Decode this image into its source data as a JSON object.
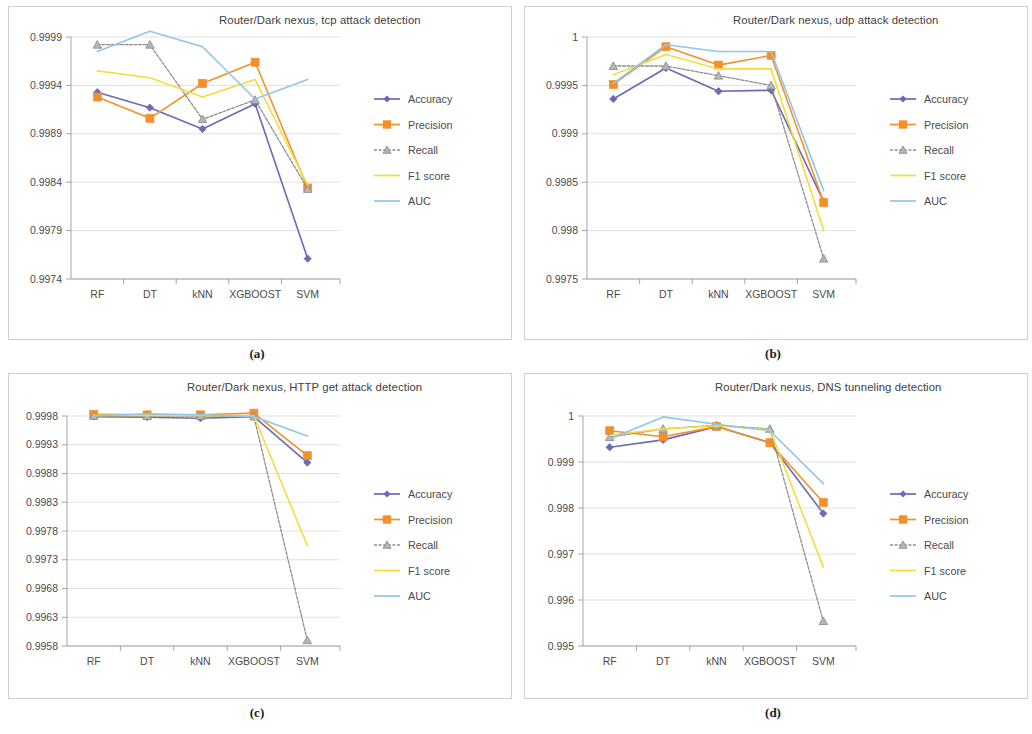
{
  "figure": {
    "panels": [
      {
        "caption": "(a)",
        "title": "Router/Dark nexus, tcp attack detection",
        "chart_data": {
          "type": "line",
          "title": "Router/Dark nexus, tcp attack detection",
          "xlabel": "",
          "ylabel": "",
          "categories": [
            "RF",
            "DT",
            "kNN",
            "XGBOOST",
            "SVM"
          ],
          "ylim": [
            0.9974,
            0.9999
          ],
          "yticks": [
            "0.9999",
            "0.9994",
            "0.9989",
            "0.9984",
            "0.9979",
            "0.9974"
          ],
          "ytick_values": [
            0.9999,
            0.9994,
            0.9989,
            0.9984,
            0.9979,
            0.9974
          ],
          "grid": true,
          "legend_position": "right",
          "series": [
            {
              "name": "Accuracy",
              "values": [
                0.99933,
                0.99917,
                0.99895,
                0.99921,
                0.99761
              ]
            },
            {
              "name": "Precision",
              "values": [
                0.99928,
                0.99906,
                0.99942,
                0.99964,
                0.99834
              ]
            },
            {
              "name": "Recall",
              "values": [
                0.99982,
                0.99982,
                0.99905,
                0.99925,
                0.99833
              ]
            },
            {
              "name": "F1 score",
              "values": [
                0.99955,
                0.99948,
                0.99928,
                0.99946,
                0.99837
              ]
            },
            {
              "name": "AUC",
              "values": [
                0.99975,
                0.99996,
                0.9998,
                0.99926,
                0.99946
              ]
            }
          ]
        }
      },
      {
        "caption": "(b)",
        "title": "Router/Dark nexus, udp attack detection",
        "chart_data": {
          "type": "line",
          "title": "Router/Dark nexus, udp attack detection",
          "xlabel": "",
          "ylabel": "",
          "categories": [
            "RF",
            "DT",
            "kNN",
            "XGBOOST",
            "SVM"
          ],
          "ylim": [
            0.9975,
            1.0
          ],
          "yticks": [
            "1",
            "0.9995",
            "0.999",
            "0.9985",
            "0.998",
            "0.9975"
          ],
          "ytick_values": [
            1.0,
            0.9995,
            0.999,
            0.9985,
            0.998,
            0.9975
          ],
          "grid": true,
          "legend_position": "right",
          "series": [
            {
              "name": "Accuracy",
              "values": [
                0.99936,
                0.99968,
                0.99944,
                0.99945,
                0.9983
              ]
            },
            {
              "name": "Precision",
              "values": [
                0.99951,
                0.9999,
                0.99971,
                0.99981,
                0.99829
              ]
            },
            {
              "name": "Recall",
              "values": [
                0.9997,
                0.9997,
                0.9996,
                0.9995,
                0.99771
              ]
            },
            {
              "name": "F1 score",
              "values": [
                0.99961,
                0.99982,
                0.99967,
                0.99967,
                0.998
              ]
            },
            {
              "name": "AUC",
              "values": [
                0.99952,
                0.99992,
                0.99985,
                0.99985,
                0.99841
              ]
            }
          ]
        }
      },
      {
        "caption": "(c)",
        "title": "Router/Dark nexus, HTTP get attack detection",
        "chart_data": {
          "type": "line",
          "title": "Router/Dark nexus, HTTP get attack detection",
          "xlabel": "",
          "ylabel": "",
          "categories": [
            "RF",
            "DT",
            "kNN",
            "XGBOOST",
            "SVM"
          ],
          "ylim": [
            0.9958,
            0.9998
          ],
          "yticks": [
            "0.9998",
            "0.9993",
            "0.9988",
            "0.9983",
            "0.9978",
            "0.9973",
            "0.9968",
            "0.9963",
            "0.9958"
          ],
          "ytick_values": [
            0.9998,
            0.9993,
            0.9988,
            0.9983,
            0.9978,
            0.9973,
            0.9968,
            0.9963,
            0.9958
          ],
          "grid": true,
          "legend_position": "right",
          "series": [
            {
              "name": "Accuracy",
              "values": [
                0.99979,
                0.99978,
                0.99976,
                0.99979,
                0.99899
              ]
            },
            {
              "name": "Precision",
              "values": [
                0.99983,
                0.99982,
                0.99982,
                0.99985,
                0.99911
              ]
            },
            {
              "name": "Recall",
              "values": [
                0.9998,
                0.9998,
                0.9998,
                0.99979,
                0.9959
              ]
            },
            {
              "name": "F1 score",
              "values": [
                0.99981,
                0.99981,
                0.99981,
                0.9998,
                0.99755
              ]
            },
            {
              "name": "AUC",
              "values": [
                0.9998,
                0.99984,
                0.99982,
                0.99979,
                0.99945
              ]
            }
          ]
        }
      },
      {
        "caption": "(d)",
        "title": "Router/Dark nexus, DNS tunneling detection",
        "chart_data": {
          "type": "line",
          "title": "Router/Dark nexus, DNS tunneling detection",
          "xlabel": "",
          "ylabel": "",
          "categories": [
            "RF",
            "DT",
            "kNN",
            "XGBOOST",
            "SVM"
          ],
          "ylim": [
            0.995,
            1.0
          ],
          "yticks": [
            "1",
            "0.999",
            "0.998",
            "0.997",
            "0.996",
            "0.995"
          ],
          "ytick_values": [
            1.0,
            0.999,
            0.998,
            0.997,
            0.996,
            0.995
          ],
          "grid": true,
          "legend_position": "right",
          "series": [
            {
              "name": "Accuracy",
              "values": [
                0.99932,
                0.99948,
                0.99977,
                0.99942,
                0.99788
              ]
            },
            {
              "name": "Precision",
              "values": [
                0.99968,
                0.99955,
                0.99977,
                0.99942,
                0.99812
              ]
            },
            {
              "name": "Recall",
              "values": [
                0.99954,
                0.99972,
                0.9998,
                0.99972,
                0.99554
              ]
            },
            {
              "name": "F1 score",
              "values": [
                0.99958,
                0.99972,
                0.99979,
                0.9997,
                0.99672
              ]
            },
            {
              "name": "AUC",
              "values": [
                0.9995,
                0.99998,
                0.99982,
                0.99968,
                0.99853
              ]
            }
          ]
        }
      }
    ],
    "legend": [
      {
        "label": "Accuracy",
        "color": "#6a6ab5",
        "marker": "diamond"
      },
      {
        "label": "Precision",
        "color": "#f3902a",
        "marker": "square"
      },
      {
        "label": "Recall",
        "color": "#8e8e8e",
        "marker": "triangle"
      },
      {
        "label": "F1 score",
        "color": "#f5dc3c",
        "marker": "none"
      },
      {
        "label": "AUC",
        "color": "#8ec6ed",
        "marker": "none"
      }
    ],
    "colors": {
      "accuracy": "#6a6ab5",
      "precision": "#f3902a",
      "recall": "#8e8e8e",
      "f1": "#f5dc3c",
      "auc": "#8ec6ed",
      "grid": "#d9d9d9",
      "axis": "#9a9a9a",
      "text": "#4a4a4a",
      "panel_border": "#cfcfcf"
    }
  }
}
